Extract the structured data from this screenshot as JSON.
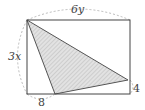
{
  "diagram": {
    "type": "geometry",
    "rectangle": {
      "x": 27,
      "y": 20,
      "width": 103,
      "height": 74
    },
    "shaded_triangle": {
      "vertices": [
        [
          27,
          20
        ],
        [
          128,
          80
        ],
        [
          55,
          94
        ]
      ],
      "fill": "#d0d0d0",
      "stroke": "#555555"
    },
    "labels": {
      "top": "6y",
      "left": "3x",
      "bottom_segment": "8",
      "right_segment": "4"
    },
    "colors": {
      "line": "#444444",
      "dashed": "#aaaaaa"
    }
  }
}
